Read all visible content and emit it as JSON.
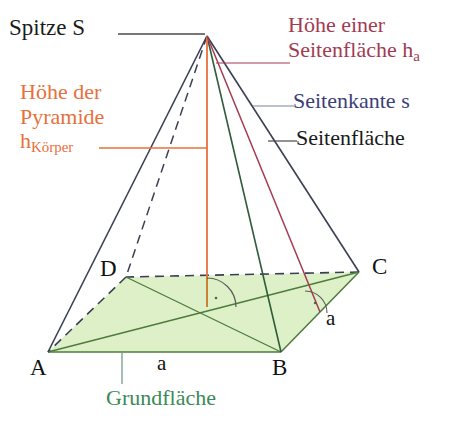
{
  "figure": {
    "colors": {
      "edge": "#3a3f55",
      "base_fill": "#ddf0c8",
      "base_stroke": "#4e7a3c",
      "height_orange": "#e8703a",
      "slant_height_crimson": "#a33b52",
      "lateral_edge_blue": "#3b3f7a",
      "background": "#ffffff",
      "label_black": "#1a1a1a",
      "label_green": "#3a8a55"
    },
    "annotations": {
      "apex": "Spitze S",
      "slant_height_line1": "Höhe einer",
      "slant_height_line2": "Seitenfläche h",
      "slant_height_sub": "a",
      "lateral_edge": "Seitenkante s",
      "lateral_face": "Seitenfläche",
      "body_height_line1": "Höhe der",
      "body_height_line2": "Pyramide",
      "body_height_line3": "h",
      "body_height_sub": "Körper",
      "base_face": "Grundfläche"
    },
    "vertices": {
      "a": "A",
      "b": "B",
      "c": "C",
      "d": "D"
    },
    "edge_lengths": {
      "ab": "a",
      "bc": "a"
    }
  },
  "geometry": {
    "apex": [
      207,
      36
    ],
    "base": {
      "a": [
        48,
        352
      ],
      "b": [
        281,
        352
      ],
      "c": [
        359,
        272
      ],
      "d": [
        126,
        277
      ],
      "center": [
        207,
        307
      ]
    },
    "midpoint_bc": [
      320,
      312
    ]
  }
}
